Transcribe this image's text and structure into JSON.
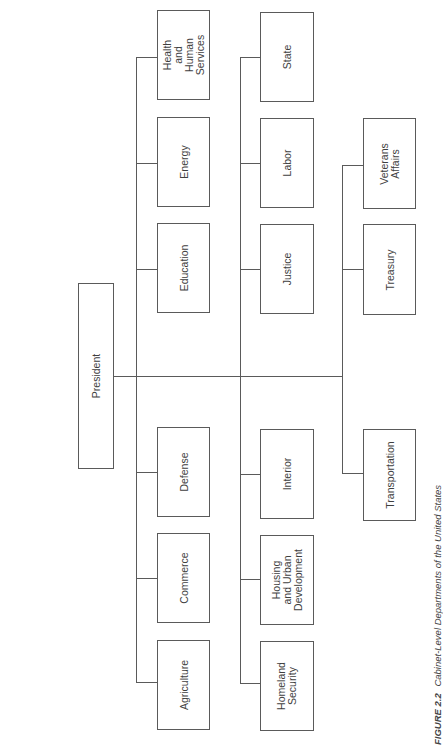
{
  "diagram": {
    "type": "org-chart",
    "orientation": "rotated-90-ccw",
    "root": {
      "label": "President"
    },
    "columns": [
      {
        "departments": [
          {
            "label": "Health and\nHuman\nServices"
          },
          {
            "label": "Energy"
          },
          {
            "label": "Education"
          },
          {
            "label": "Defense"
          },
          {
            "label": "Commerce"
          },
          {
            "label": "Agriculture"
          }
        ]
      },
      {
        "departments": [
          {
            "label": "State"
          },
          {
            "label": "Labor"
          },
          {
            "label": "Justice"
          },
          {
            "label": "Interior"
          },
          {
            "label": "Housing\nand Urban\nDevelopment"
          },
          {
            "label": "Homeland\nSecurity"
          }
        ]
      },
      {
        "departments": [
          {
            "label": "Veterans\nAffairs"
          },
          {
            "label": "Treasury"
          },
          {
            "label": "Transportation"
          }
        ]
      }
    ]
  },
  "caption": {
    "figure_label": "FIGURE 2.2",
    "title": "Cabinet-Level Departments of the United States"
  },
  "colors": {
    "line": "#5a5a5a",
    "text": "#3f3f3f",
    "background": "#ffffff"
  }
}
